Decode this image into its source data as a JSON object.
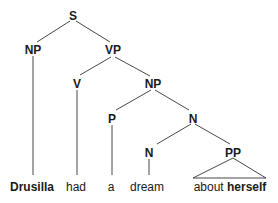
{
  "diagram": {
    "type": "syntax-tree",
    "nodes": {
      "s": {
        "label": "S"
      },
      "np_subj": {
        "label": "NP"
      },
      "vp": {
        "label": "VP"
      },
      "v": {
        "label": "V"
      },
      "np_obj": {
        "label": "NP"
      },
      "p": {
        "label": "P"
      },
      "n_bar": {
        "label": "N"
      },
      "n": {
        "label": "N"
      },
      "pp": {
        "label": "PP"
      }
    },
    "leaves": {
      "drusilla": {
        "text": "Drusilla",
        "bold": true
      },
      "had": {
        "text": "had",
        "bold": false
      },
      "a": {
        "text": "a",
        "bold": false
      },
      "dream": {
        "text": "dream",
        "bold": false
      },
      "about": {
        "text": "about",
        "bold": false
      },
      "herself": {
        "text": "herself",
        "bold": true
      }
    },
    "edges": [
      [
        "S",
        "NP"
      ],
      [
        "S",
        "VP"
      ],
      [
        "NP",
        "Drusilla"
      ],
      [
        "VP",
        "V"
      ],
      [
        "VP",
        "NP"
      ],
      [
        "V",
        "had"
      ],
      [
        "NP",
        "P"
      ],
      [
        "NP",
        "N"
      ],
      [
        "P",
        "a"
      ],
      [
        "N",
        "N"
      ],
      [
        "N",
        "PP"
      ],
      [
        "N",
        "dream"
      ],
      [
        "PP",
        "about herself (triangle)"
      ]
    ]
  }
}
